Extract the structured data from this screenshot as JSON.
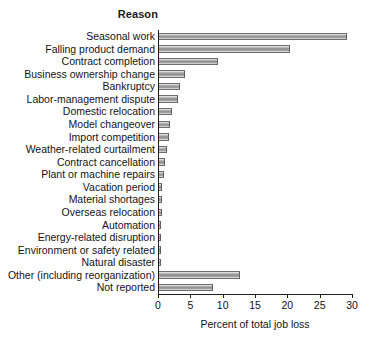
{
  "heading": "Reason",
  "chart_data": {
    "type": "bar",
    "orientation": "horizontal",
    "title": "Reason",
    "xlabel": "Percent of total job loss",
    "ylabel": "Reason",
    "xlim": [
      0,
      30
    ],
    "xticks": [
      0,
      5,
      10,
      15,
      20,
      25,
      30
    ],
    "xtick_labels": [
      "0",
      "5",
      "10",
      "15",
      "20",
      "25",
      "30"
    ],
    "grid": false,
    "legend": null,
    "bar_color": "#9a9a9a",
    "bar_edge_color": "#5f5f5f",
    "axis_color": "#1d1d1d",
    "categories": [
      "Seasonal work",
      "Falling product demand",
      "Contract completion",
      "Business ownership change",
      "Bankruptcy",
      "Labor-management dispute",
      "Domestic relocation",
      "Model changeover",
      "Import competition",
      "Weather-related curtailment",
      "Contract cancellation",
      "Plant or machine repairs",
      "Vacation period",
      "Material shortages",
      "Overseas relocation",
      "Automation",
      "Energy-related disruption",
      "Environment or safety related",
      "Natural disaster",
      "Other (including reorganization)",
      "Not reported"
    ],
    "values": [
      29.1,
      20.2,
      9.1,
      4.0,
      3.3,
      2.9,
      2.0,
      1.7,
      1.5,
      1.3,
      0.9,
      0.7,
      0.5,
      0.5,
      0.4,
      0.3,
      0.3,
      0.2,
      0.2,
      12.6,
      8.3
    ]
  }
}
